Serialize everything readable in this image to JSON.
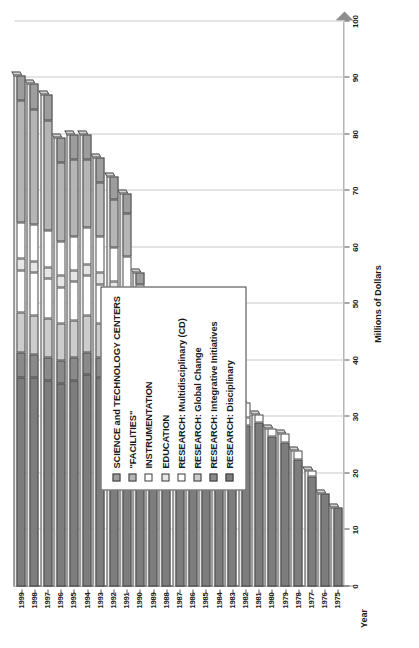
{
  "chart_data": {
    "type": "bar",
    "subtype": "stacked-horizontal-3d",
    "title": "",
    "xlabel": "Year",
    "ylabel": "Millions of Dollars",
    "ylim": [
      0,
      100
    ],
    "ytick_step": 10,
    "yticks": [
      0,
      10,
      20,
      30,
      40,
      50,
      60,
      70,
      80,
      90,
      100
    ],
    "grid": true,
    "grid_axis": "value",
    "legend_position": "plot-inside-left",
    "orientation": "page-rotated-90-ccw",
    "categories": [
      "1975",
      "1976",
      "1977",
      "1978",
      "1979",
      "1980",
      "1981",
      "1982",
      "1983",
      "1984",
      "1985",
      "1986",
      "1987",
      "1988",
      "1989",
      "1990",
      "1991",
      "1992",
      "1993",
      "1994",
      "1995",
      "1996",
      "1997",
      "1998",
      "1999"
    ],
    "series": [
      {
        "name": "RESEARCH: Disciplinary",
        "color": "#7d7d7d",
        "values": [
          14.0,
          16.5,
          19.5,
          22.5,
          25.5,
          26.5,
          29.0,
          28.5,
          27.5,
          28.0,
          30.5,
          32.0,
          33.5,
          34.5,
          35.0,
          35.5,
          36.0,
          36.5,
          37.0,
          37.5,
          36.5,
          36.0,
          36.5,
          37.0,
          37.0
        ]
      },
      {
        "name": "RESEARCH: Integrative Initiatives",
        "color": "#8a8a8a",
        "values": [
          0,
          0,
          0,
          0,
          0,
          0,
          0,
          0,
          0,
          0,
          0,
          0,
          0,
          0,
          0,
          0,
          3.0,
          3.5,
          3.5,
          4.0,
          4.0,
          4.0,
          4.0,
          4.0,
          4.5
        ]
      },
      {
        "name": "RESEARCH: Global Change",
        "color": "#cccccc",
        "values": [
          0,
          0,
          0,
          0,
          0,
          0,
          0,
          0,
          0,
          0,
          0,
          0,
          0,
          0,
          0,
          3.0,
          5.0,
          5.5,
          6.0,
          6.5,
          6.5,
          6.5,
          7.0,
          7.0,
          7.0
        ]
      },
      {
        "name": "RESEARCH: Multidisciplinary (CD)",
        "color": "#ffffff",
        "values": [
          0,
          0,
          0,
          0,
          0,
          0,
          0,
          1.5,
          2.5,
          4.0,
          5.0,
          5.5,
          6.0,
          6.5,
          7.0,
          7.5,
          6.5,
          6.5,
          7.0,
          7.0,
          7.0,
          6.5,
          7.0,
          7.5,
          7.5
        ]
      },
      {
        "name": "EDUCATION",
        "color": "#e6e6e6",
        "values": [
          0,
          0,
          0,
          0,
          0,
          0,
          0,
          0,
          0,
          0,
          0,
          0,
          0,
          0,
          1.5,
          1.5,
          2.0,
          2.0,
          2.0,
          2.0,
          2.0,
          2.0,
          2.0,
          2.0,
          2.0
        ]
      },
      {
        "name": "INSTRUMENTATION",
        "color": "#ffffff",
        "values": [
          0,
          0,
          1.0,
          1.5,
          1.5,
          1.5,
          1.5,
          2.5,
          5.0,
          5.5,
          6.0,
          6.5,
          6.5,
          7.0,
          6.0,
          6.0,
          6.0,
          6.0,
          6.5,
          6.5,
          6.0,
          6.0,
          6.5,
          6.5,
          6.5
        ]
      },
      {
        "name": "\"FACILITIES\"",
        "color": "#b5b5b5",
        "values": [
          0,
          0,
          0,
          0,
          0,
          0,
          0,
          0,
          0,
          0,
          0,
          0,
          0,
          0,
          0,
          0,
          7.5,
          8.5,
          9.5,
          12.0,
          13.5,
          14.0,
          19.5,
          20.5,
          21.5
        ]
      },
      {
        "name": "SCIENCE and TECHNOLOGY CENTERS",
        "color": "#9d9d9d",
        "values": [
          0,
          0,
          0,
          0,
          0,
          0,
          0,
          0,
          0,
          0,
          0,
          0,
          0,
          0,
          0,
          2.0,
          3.5,
          4.0,
          4.5,
          4.5,
          4.5,
          4.5,
          4.5,
          4.5,
          4.5
        ]
      }
    ],
    "legend_entries": [
      {
        "label": "SCIENCE and TECHNOLOGY CENTERS",
        "color": "#9d9d9d"
      },
      {
        "label": "\"FACILITIES\"",
        "color": "#b5b5b5"
      },
      {
        "label": "INSTRUMENTATION",
        "color": "#ffffff"
      },
      {
        "label": "EDUCATION",
        "color": "#e6e6e6"
      },
      {
        "label": "RESEARCH: Multidisciplinary (CD)",
        "color": "#ffffff"
      },
      {
        "label": "RESEARCH: Global Change",
        "color": "#cccccc"
      },
      {
        "label": "RESEARCH: Integrative Initiatives",
        "color": "#8a8a8a"
      },
      {
        "label": "RESEARCH: Disciplinary",
        "color": "#7d7d7d"
      }
    ]
  }
}
